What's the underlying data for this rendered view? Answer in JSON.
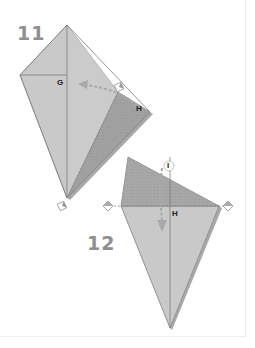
{
  "steps": [
    {
      "number": "11",
      "labels": {
        "g": "G",
        "h": "H"
      },
      "action": "valley-fold right edge to center crease",
      "symbols": [
        "fold-arrow-dashed",
        "pivot-marker",
        "pivot-marker"
      ]
    },
    {
      "number": "12",
      "labels": {
        "i": "I",
        "h": "H"
      },
      "action": "fold top triangle down along horizontal line",
      "symbols": [
        "fold-arrow-dashed",
        "pivot-marker",
        "pivot-marker"
      ]
    }
  ],
  "colors": {
    "paper_light": "#c8c8c8",
    "paper_mid": "#bdbdbd",
    "paper_dark": "#9c9c9c",
    "edge": "#8a8a8a",
    "shadow": "#a5a5a5",
    "number": "#8f8f8f",
    "arrow": "#a9a9a9"
  }
}
